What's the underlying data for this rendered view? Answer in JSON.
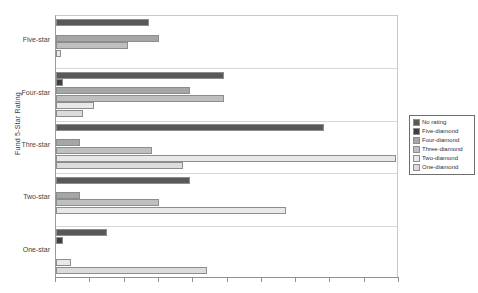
{
  "chart_data": {
    "type": "bar",
    "orientation": "horizontal",
    "title": "",
    "xlabel": "",
    "ylabel": "Fund 5-Star Rating",
    "categories": [
      "Five-star",
      "Four-star",
      "Thre-star",
      "Two-star",
      "One-star"
    ],
    "xlim": [
      0,
      10
    ],
    "xticks": [
      0,
      1,
      2,
      3,
      4,
      5,
      6,
      7,
      8,
      9,
      10
    ],
    "xtick_labels": [
      "",
      "",
      "",
      "",
      "",
      "",
      "",
      "",
      "",
      "",
      ""
    ],
    "grid": false,
    "legend_position": "right",
    "series": [
      {
        "name": "No rating",
        "color": "#595959",
        "values": [
          2.7,
          4.9,
          7.8,
          3.9,
          1.5
        ]
      },
      {
        "name": "Five-diamond",
        "color": "#3f3f3f",
        "values": [
          0.0,
          0.2,
          0.0,
          0.0,
          0.2
        ]
      },
      {
        "name": "Four-diamond",
        "color": "#a6a6a6",
        "values": [
          3.0,
          3.9,
          0.7,
          0.7,
          0.0
        ]
      },
      {
        "name": "Three-diamond",
        "color": "#bfbfbf",
        "values": [
          2.1,
          4.9,
          2.8,
          3.0,
          0.0
        ]
      },
      {
        "name": "Two-diamond",
        "color": "#e8e8e8",
        "values": [
          0.15,
          1.1,
          9.9,
          6.7,
          0.45
        ]
      },
      {
        "name": "One-diamond",
        "color": "#dcdcdc",
        "values": [
          0.0,
          0.8,
          3.7,
          0.0,
          4.4
        ]
      }
    ]
  },
  "legend": {
    "items": [
      {
        "label": "No rating",
        "color": "#595959"
      },
      {
        "label": "Five-diamond",
        "color": "#3f3f3f"
      },
      {
        "label": "Four-diamond",
        "color": "#a6a6a6"
      },
      {
        "label": "Three-diamond",
        "color": "#bfbfbf"
      },
      {
        "label": "Two-diamond",
        "color": "#e8e8e8"
      },
      {
        "label": "One-diamond",
        "color": "#dcdcdc"
      }
    ]
  }
}
